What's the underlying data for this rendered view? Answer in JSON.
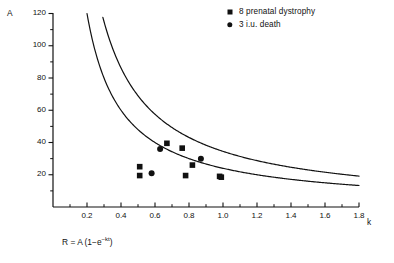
{
  "chart_data": {
    "type": "scatter",
    "title": "",
    "xlabel": "k",
    "ylabel": "A",
    "xlim": [
      0,
      1.8
    ],
    "ylim": [
      0,
      120
    ],
    "grid": false,
    "legend_position": "top-right",
    "xticks": [
      "0.2",
      "0.4",
      "0.6",
      "0.8",
      "1.0",
      "1.2",
      "1.4",
      "1.6",
      "1.8"
    ],
    "xtick_values": [
      0.2,
      0.4,
      0.6,
      0.8,
      1.0,
      1.2,
      1.4,
      1.6,
      1.8
    ],
    "yticks": [
      "20",
      "40",
      "60",
      "80",
      "100",
      "120"
    ],
    "ytick_values": [
      20,
      40,
      60,
      80,
      100,
      120
    ],
    "x_minor_tick_step": 0.1,
    "y_minor_tick_step": 10,
    "annotation": "R = A(1-e-kt)",
    "annotation_parts": {
      "lead": "R = A (1",
      "minus": "−",
      "base": "e",
      "exponent": "−kt",
      "tail": ")"
    },
    "series": [
      {
        "name": "8 prenatal dystrophy",
        "marker": "square",
        "color": "#111111",
        "count": 8,
        "points": [
          {
            "k": 0.51,
            "A": 25.0
          },
          {
            "k": 0.51,
            "A": 19.5
          },
          {
            "k": 0.67,
            "A": 39.5
          },
          {
            "k": 0.76,
            "A": 36.5
          },
          {
            "k": 0.78,
            "A": 19.5
          },
          {
            "k": 0.82,
            "A": 26.0
          },
          {
            "k": 0.98,
            "A": 19.0
          },
          {
            "k": 0.99,
            "A": 18.5
          }
        ]
      },
      {
        "name": "3 i.u. death",
        "marker": "circle",
        "color": "#111111",
        "count": 3,
        "points": [
          {
            "k": 0.58,
            "A": 21.0
          },
          {
            "k": 0.63,
            "A": 36.0
          },
          {
            "k": 0.87,
            "A": 30.0
          }
        ]
      }
    ],
    "curves": [
      {
        "name": "upper-boundary-curve",
        "model": "A = c / k",
        "c": 34.5,
        "color": "#111111",
        "k_start": 0.2875,
        "k_end": 1.8,
        "A_at_k_end": 19.2
      },
      {
        "name": "lower-boundary-curve",
        "model": "A = c / k",
        "c": 24.0,
        "color": "#111111",
        "k_start": 0.2,
        "k_end": 1.8,
        "A_at_k_end": 13.3
      }
    ]
  },
  "legend": {
    "items": [
      {
        "marker": "square",
        "label": "8 prenatal dystrophy"
      },
      {
        "marker": "circle",
        "label": "3 i.u. death"
      }
    ]
  },
  "axes": {
    "y_name": "A",
    "x_name": "k"
  }
}
